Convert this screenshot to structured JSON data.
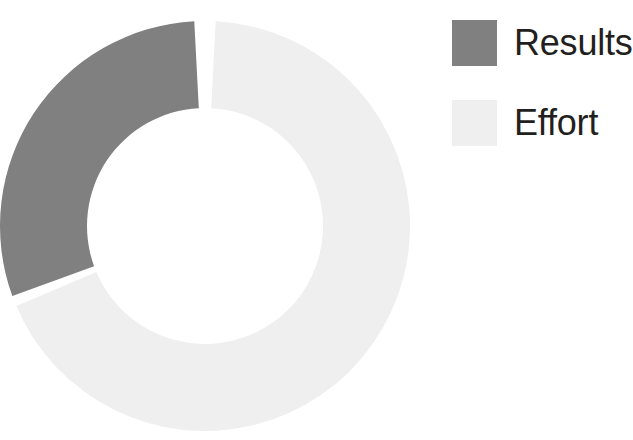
{
  "chart_data": {
    "type": "pie",
    "variant": "donut",
    "title": "",
    "subtitle": "",
    "xlabel": "",
    "ylabel": "",
    "grid": false,
    "legend_position": "right",
    "categories": [
      "Results",
      "Effort"
    ],
    "values": [
      30,
      70
    ],
    "units": "percent",
    "slices": [
      {
        "label": "Results",
        "value": 30,
        "percent": 30,
        "color": "#808080",
        "start_angle_deg": -110,
        "end_angle_deg": -3,
        "sweep_deg": 107
      },
      {
        "label": "Effort",
        "value": 70,
        "percent": 70,
        "color": "#efefef",
        "start_angle_deg": 3,
        "end_angle_deg": 247,
        "sweep_deg": 244
      }
    ],
    "geometry": {
      "center_x": 205,
      "center_y": 226,
      "outer_radius": 205,
      "inner_radius": 118,
      "gap_deg": 6,
      "start_at_top": true,
      "direction": "clockwise"
    },
    "annotations": []
  },
  "legend": {
    "items": [
      {
        "label": "Results",
        "color": "#808080",
        "swatch": "legend-swatch-square"
      },
      {
        "label": "Effort",
        "color": "#efefef",
        "swatch": "legend-swatch-square"
      }
    ]
  },
  "colors": {
    "background": "#ffffff",
    "results": "#808080",
    "effort": "#efefef",
    "text": "#231f20"
  }
}
